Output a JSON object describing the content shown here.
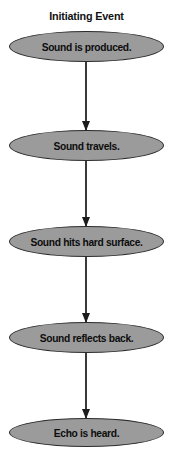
{
  "diagram": {
    "title": "Initiating Event",
    "background_color": "#ffffff",
    "node_fill_color": "#9b9b9b",
    "node_border_color": "#2b2b2b",
    "node_text_color": "#0d0d0d",
    "connector_color": "#3a3a3a",
    "nodes": [
      {
        "label": "Sound is produced."
      },
      {
        "label": "Sound travels."
      },
      {
        "label": "Sound hits hard surface."
      },
      {
        "label": "Sound reflects back."
      },
      {
        "label": "Echo is heard."
      }
    ]
  }
}
